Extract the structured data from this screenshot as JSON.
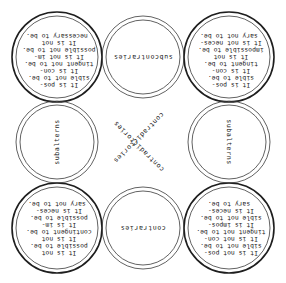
{
  "diagram": {
    "orientation": "rotated-180",
    "corners": {
      "top_left": {
        "lines": [
          "It is pos-",
          "sible not to be.",
          "It is con-",
          "tingent not to be.",
          "It is not im-",
          "possible not to be.",
          "It is not",
          "necessary to be."
        ]
      },
      "top_right": {
        "lines": [
          "It is pos-",
          "sible to be.",
          "It is con-",
          "tingent to be.",
          "It is not",
          "impossible to be.",
          "It is not neces-",
          "sary not to be."
        ]
      },
      "bottom_left": {
        "lines": [
          "It is not",
          "possible to be.",
          "It is not",
          "contingent to be.",
          "It is im-",
          "possible to be.",
          "It is neces-",
          "sary not to be."
        ]
      },
      "bottom_right": {
        "lines": [
          "It is not pos-",
          "sible not to be.",
          "It is not con-",
          "tingent not to be.",
          "It is impos-",
          "sible not to be.",
          "It is neces-",
          "sary to be."
        ]
      }
    },
    "relations": {
      "top": "subcontraries",
      "bottom": "contraries",
      "left": "subalterns",
      "right": "subalterns",
      "diagonal_1": "contradictories",
      "diagonal_2": "contradictories"
    },
    "colors": {
      "ink": "#1e1e1e",
      "background": "#ffffff"
    }
  }
}
